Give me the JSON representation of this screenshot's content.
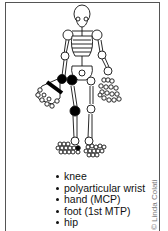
{
  "figure": {
    "type": "skeleton-joint-diagram",
    "highlight_color": "#000000",
    "affected_joints_marked": [
      "right knee",
      "right hip",
      "right wrist",
      "right MCP row",
      "right 1st MTP"
    ]
  },
  "legend": {
    "items": [
      {
        "label": "knee"
      },
      {
        "label": "polyarticular wrist"
      },
      {
        "label": "hand (MCP)"
      },
      {
        "label": "foot (1st MTP)"
      },
      {
        "label": "hip"
      }
    ]
  },
  "credit": "© Linda Colati"
}
